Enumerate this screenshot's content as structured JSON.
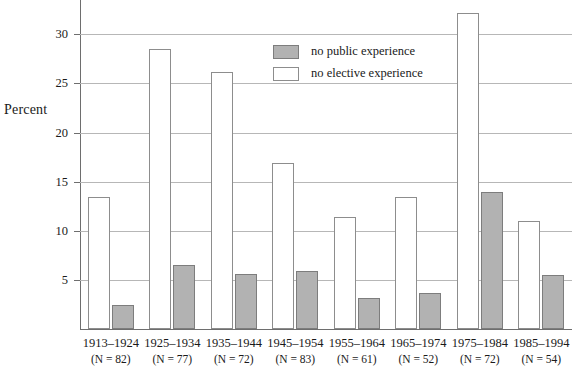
{
  "chart_data": {
    "type": "bar",
    "title": "",
    "xlabel": "",
    "ylabel": "Percent",
    "ylim": [
      0,
      33.5
    ],
    "yticks": [
      5,
      10,
      15,
      20,
      25,
      30
    ],
    "grid": true,
    "legend_position": "top-center",
    "categories": [
      "1913–1924",
      "1925–1934",
      "1935–1944",
      "1945–1954",
      "1955–1964",
      "1965–1974",
      "1975–1984",
      "1985–1994"
    ],
    "category_notes": [
      "(N = 82)",
      "(N = 77)",
      "(N = 72)",
      "(N = 83)",
      "(N = 61)",
      "(N = 52)",
      "(N = 72)",
      "(N = 54)"
    ],
    "series": [
      {
        "name": "no elective experience",
        "style": "hollow",
        "color": "#ffffff",
        "border_color": "#8d8d8d",
        "values": [
          13.4,
          28.5,
          26.2,
          16.9,
          11.4,
          13.4,
          32.2,
          11.0
        ]
      },
      {
        "name": "no public experience",
        "style": "filled",
        "color": "#b2b2b2",
        "border_color": "#7d7d7d",
        "values": [
          2.4,
          6.5,
          5.6,
          5.9,
          3.2,
          3.7,
          14.0,
          5.5
        ]
      }
    ]
  },
  "legend": {
    "items": [
      {
        "label": "no public experience",
        "style": "filled"
      },
      {
        "label": "no elective experience",
        "style": "hollow"
      }
    ]
  }
}
